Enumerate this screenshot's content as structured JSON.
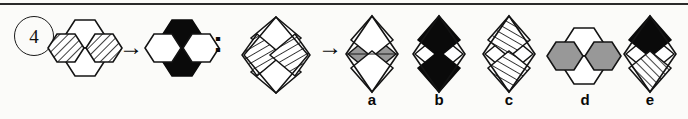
{
  "question": {
    "number": "4",
    "type": "analogy-matrix",
    "relation_separator": ":",
    "arrow_glyph": "→"
  },
  "colors": {
    "ink": "#141414",
    "white": "#ffffff",
    "black": "#0a0a0a",
    "gray": "#989898",
    "hatch": "#1d1d1d",
    "page": "#fbfbf9"
  },
  "stimulus": {
    "pair_a": {
      "name": "hexagon-cluster-source",
      "shape": "hexagon-cluster",
      "cells": {
        "top": "white",
        "left": "hatched",
        "right": "hatched",
        "bottom": "white"
      }
    },
    "pair_b": {
      "name": "hexagon-cluster-result",
      "shape": "hexagon-cluster",
      "cells": {
        "top": "black",
        "left": "white",
        "right": "white",
        "bottom": "black"
      }
    },
    "pair_c": {
      "name": "diamond-cluster-source",
      "shape": "diamond-cluster",
      "cells": {
        "top": "white",
        "left": "hatched",
        "right": "hatched",
        "bottom": "white"
      }
    },
    "pair_d": {
      "name": "answer-placeholder",
      "shape": "unknown",
      "cells": {}
    }
  },
  "options": [
    {
      "label": "a",
      "shape": "diamond-cluster",
      "cells": {
        "top": "white",
        "left": "gray",
        "right": "gray",
        "bottom": "white"
      }
    },
    {
      "label": "b",
      "shape": "diamond-cluster",
      "cells": {
        "top": "black",
        "left": "white",
        "right": "white",
        "bottom": "black"
      }
    },
    {
      "label": "c",
      "shape": "diamond-cluster",
      "cells": {
        "top": "hatched",
        "left": "white",
        "right": "white",
        "bottom": "hatched"
      }
    },
    {
      "label": "d",
      "shape": "hexagon-cluster",
      "cells": {
        "top": "white",
        "left": "gray",
        "right": "gray",
        "bottom": "white"
      }
    },
    {
      "label": "e",
      "shape": "diamond-cluster",
      "cells": {
        "top": "black",
        "left": "white",
        "right": "white",
        "bottom": "hatched"
      }
    }
  ]
}
